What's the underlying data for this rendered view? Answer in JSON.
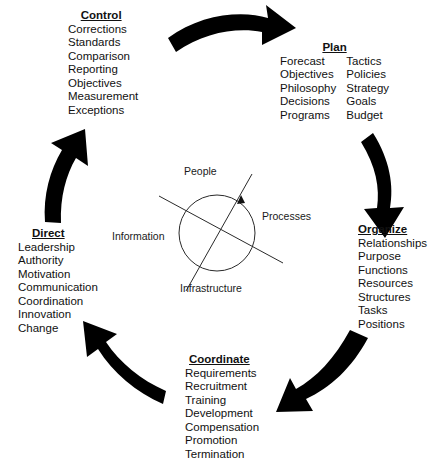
{
  "diagram": {
    "type": "cycle-diagram",
    "arrow_color": "#000000",
    "text_color": "#111111",
    "background": "#ffffff",
    "stages": [
      {
        "id": "control",
        "title": "Control",
        "columns": [
          [
            "Corrections",
            "Standards",
            "Comparison",
            "Reporting",
            "Objectives",
            "Measurement",
            "Exceptions"
          ]
        ]
      },
      {
        "id": "plan",
        "title": "Plan",
        "columns": [
          [
            "Forecast",
            "Objectives",
            "Philosophy",
            "Decisions",
            "Programs"
          ],
          [
            "Tactics",
            "Policies",
            "Strategy",
            "Goals",
            "Budget"
          ]
        ]
      },
      {
        "id": "organize",
        "title": "Organize",
        "columns": [
          [
            "Relationships",
            "Purpose",
            "Functions",
            "Resources",
            "Structures",
            "Tasks",
            "Positions"
          ]
        ]
      },
      {
        "id": "coordinate",
        "title": "Coordinate",
        "columns": [
          [
            "Requirements",
            "Recruitment",
            "Training",
            "Development",
            "Compensation",
            "Promotion",
            "Termination"
          ]
        ]
      },
      {
        "id": "direct",
        "title": "Direct",
        "columns": [
          [
            "Leadership",
            "Authority",
            "Motivation",
            "Communication",
            "Coordination",
            "Innovation",
            "Change"
          ]
        ]
      }
    ],
    "core": {
      "labels": {
        "top": "People",
        "right": "Processes",
        "left": "Information",
        "bottom": "Infrastructure"
      }
    },
    "arrows": [
      {
        "id": "control-to-plan",
        "from": "Control",
        "to": "Plan",
        "direction": "right"
      },
      {
        "id": "plan-to-organize",
        "from": "Plan",
        "to": "Organize",
        "direction": "down"
      },
      {
        "id": "organize-to-coordinate",
        "from": "Organize",
        "to": "Coordinate",
        "direction": "down-left"
      },
      {
        "id": "coordinate-to-direct",
        "from": "Coordinate",
        "to": "Direct",
        "direction": "up-left"
      },
      {
        "id": "direct-to-control",
        "from": "Direct",
        "to": "Control",
        "direction": "up"
      }
    ]
  }
}
